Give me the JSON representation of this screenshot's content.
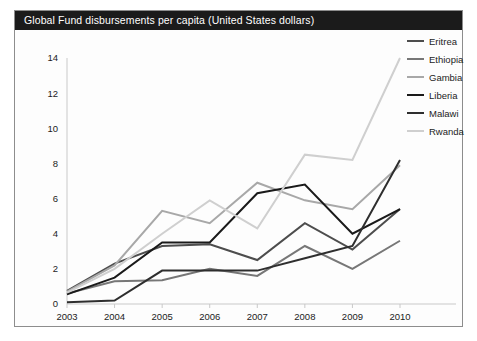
{
  "figure": {
    "title": "Global Fund disbursements per capita (United States dollars)"
  },
  "chart_data": {
    "type": "line",
    "title": "Global Fund disbursements per capita (United States dollars)",
    "xlabel": "",
    "ylabel": "",
    "categories": [
      "2003",
      "2004",
      "2005",
      "2006",
      "2007",
      "2008",
      "2009",
      "2010"
    ],
    "x": [
      2003,
      2004,
      2005,
      2006,
      2007,
      2008,
      2009,
      2010
    ],
    "ylim": [
      0,
      14
    ],
    "yticks": [
      0,
      2,
      4,
      6,
      8,
      10,
      12,
      14
    ],
    "ytick_labels": [
      "0",
      "2",
      "4",
      "6",
      "8",
      "10",
      "12",
      "14"
    ],
    "grid": false,
    "legend_position": "right",
    "series": [
      {
        "name": "Eritrea",
        "color": "#4d4d4d",
        "values": [
          0.75,
          2.3,
          3.3,
          3.4,
          2.5,
          4.6,
          3.1,
          5.4
        ]
      },
      {
        "name": "Ethiopia",
        "color": "#777777",
        "values": [
          0.6,
          1.3,
          1.35,
          2.0,
          1.6,
          3.3,
          2.0,
          3.6
        ]
      },
      {
        "name": "Gambia",
        "color": "#a8a8a8",
        "values": [
          0.7,
          2.2,
          5.3,
          4.6,
          6.9,
          5.9,
          5.4,
          7.9
        ]
      },
      {
        "name": "Liberia",
        "color": "#1a1a1a",
        "values": [
          0.55,
          1.5,
          3.5,
          3.5,
          6.3,
          6.8,
          4.0,
          5.4
        ]
      },
      {
        "name": "Malawi",
        "color": "#2e2e2e",
        "values": [
          0.1,
          0.2,
          1.9,
          1.9,
          1.9,
          2.6,
          3.3,
          8.2
        ]
      },
      {
        "name": "Rwanda",
        "color": "#cfcfcf",
        "values": [
          0.65,
          2.0,
          4.0,
          5.9,
          4.3,
          8.5,
          8.2,
          14.0
        ]
      }
    ]
  },
  "legend": {
    "items": [
      {
        "label": "Eritrea"
      },
      {
        "label": "Ethiopia"
      },
      {
        "label": "Gambia"
      },
      {
        "label": "Liberia"
      },
      {
        "label": "Malawi"
      },
      {
        "label": "Rwanda"
      }
    ]
  }
}
